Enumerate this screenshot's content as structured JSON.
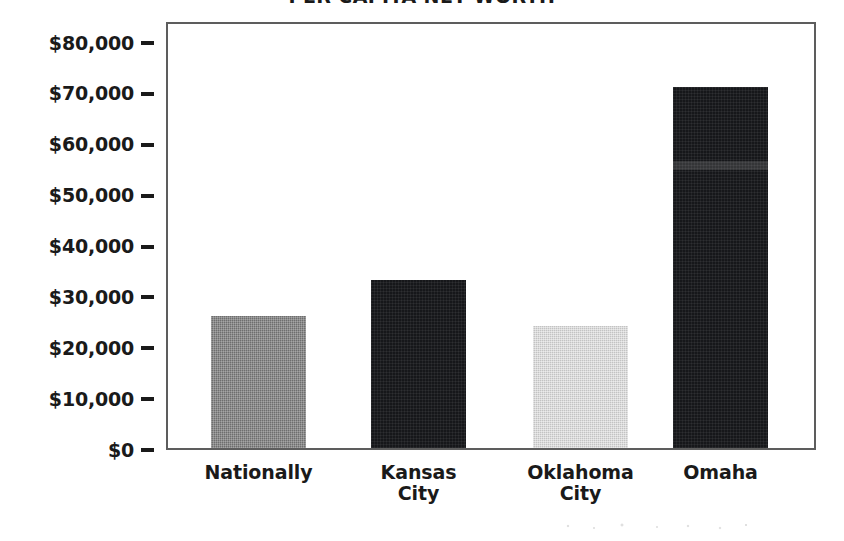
{
  "chart_data": {
    "type": "bar",
    "title": "PER CAPITA NET WORTH",
    "xlabel": "",
    "ylabel": "",
    "categories": [
      "Nationally",
      "Kansas City",
      "Oklahoma City",
      "Omaha"
    ],
    "values": [
      26000,
      33000,
      24000,
      71000
    ],
    "series": [
      {
        "name": "Per Capita Net Worth",
        "values": [
          26000,
          33000,
          24000,
          71000
        ]
      }
    ],
    "ylim": [
      0,
      80000
    ],
    "y_tick_values": [
      80000,
      70000,
      60000,
      50000,
      40000,
      30000,
      20000,
      10000,
      0
    ],
    "y_tick_labels": [
      "$80,000",
      "$70,000",
      "$60,000",
      "$50,000",
      "$40,000",
      "$30,000",
      "$20,000",
      "$10,000",
      "$0"
    ],
    "grid": false,
    "legend": false,
    "legend_position": "none",
    "bar_fills": [
      "medium-gray-dither",
      "dark-dither",
      "light-gray-dither",
      "dark-dither"
    ],
    "bar_colors": [
      "#6e6e6e",
      "#16171a",
      "#c3c3c3",
      "#16171a"
    ]
  },
  "chart": {
    "title": "PER CAPITA NET WORTH",
    "axis": {
      "y_ticks": [
        {
          "label": "$80,000",
          "value": 80000
        },
        {
          "label": "$70,000",
          "value": 70000
        },
        {
          "label": "$60,000",
          "value": 60000
        },
        {
          "label": "$50,000",
          "value": 50000
        },
        {
          "label": "$40,000",
          "value": 40000
        },
        {
          "label": "$30,000",
          "value": 30000
        },
        {
          "label": "$20,000",
          "value": 20000
        },
        {
          "label": "$10,000",
          "value": 10000
        },
        {
          "label": "$0",
          "value": 0
        }
      ]
    },
    "bars": [
      {
        "label": "Nationally",
        "label_line1": "Nationally",
        "label_line2": "",
        "value": 26000,
        "fill": "medium",
        "color": "#6e6e6e"
      },
      {
        "label": "Kansas City",
        "label_line1": "Kansas",
        "label_line2": "City",
        "value": 33000,
        "fill": "dark",
        "color": "#16171a"
      },
      {
        "label": "Oklahoma City",
        "label_line1": "Oklahoma",
        "label_line2": "City",
        "value": 24000,
        "fill": "light",
        "color": "#c3c3c3"
      },
      {
        "label": "Omaha",
        "label_line1": "Omaha",
        "label_line2": "",
        "value": 71000,
        "fill": "dark",
        "color": "#16171a"
      }
    ]
  }
}
